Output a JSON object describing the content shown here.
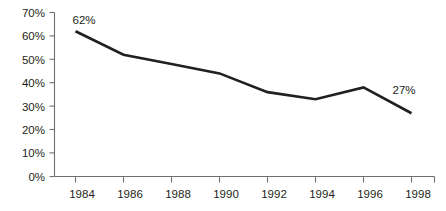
{
  "chart_data": {
    "type": "line",
    "title": "",
    "subtitle": "",
    "xlabel": "",
    "ylabel": "",
    "x": [
      1984,
      1986,
      1988,
      1990,
      1992,
      1994,
      1996,
      1998
    ],
    "categories": [
      "1984",
      "1986",
      "1988",
      "1990",
      "1992",
      "1994",
      "1996",
      "1998"
    ],
    "values": [
      62,
      52,
      48,
      44,
      36,
      33,
      38,
      27
    ],
    "series": [
      {
        "name": "",
        "values": [
          62,
          52,
          48,
          44,
          36,
          33,
          38,
          27
        ]
      }
    ],
    "ylim": [
      0,
      70
    ],
    "xlim": [
      1983,
      1999
    ],
    "y_ticks": [
      0,
      10,
      20,
      30,
      40,
      50,
      60,
      70
    ],
    "y_tick_labels": [
      "0%",
      "10%",
      "20%",
      "30%",
      "40%",
      "50%",
      "60%",
      "70%"
    ],
    "x_ticks": [
      1984,
      1986,
      1988,
      1990,
      1992,
      1994,
      1996,
      1998
    ],
    "x_tick_labels": [
      "1984",
      "1986",
      "1988",
      "1990",
      "1992",
      "1994",
      "1996",
      "1998"
    ],
    "grid": false,
    "legend": false,
    "legend_position": "none",
    "annotations": [
      {
        "label": "62%",
        "x": 1984,
        "y": 62,
        "px": 84,
        "py": 24
      },
      {
        "label": "27%",
        "x": 1998,
        "y": 27,
        "px": 404,
        "py": 94
      }
    ],
    "colors": {
      "line": "#231f20",
      "axis": "#6d6e71",
      "text": "#231f20",
      "background": "#ffffff"
    }
  },
  "axes": {
    "y_labels": [
      "70%",
      "60%",
      "50%",
      "40%",
      "30%",
      "20%",
      "10%",
      "0%"
    ],
    "x_labels": [
      "1984",
      "1986",
      "1988",
      "1990",
      "1992",
      "1994",
      "1996",
      "1998"
    ]
  },
  "annotations": {
    "start": "62%",
    "end": "27%"
  }
}
